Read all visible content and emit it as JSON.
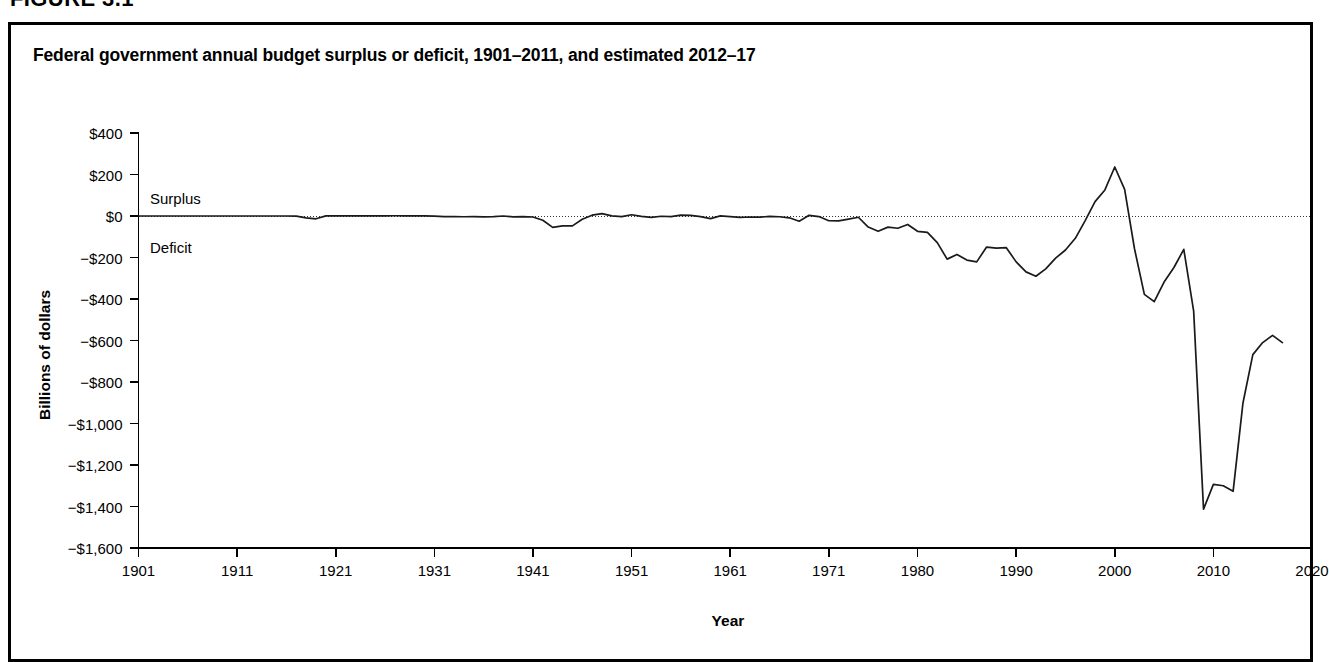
{
  "figure": {
    "number_label": "FIGURE 3.1"
  },
  "chart_title": "Federal government annual budget surplus or deficit, 1901–2011, and estimated 2012–17",
  "annotations": {
    "surplus": "Surplus",
    "deficit": "Deficit"
  },
  "colors": {
    "line": "#1a1a1a",
    "axis": "#000000",
    "zero_line": "#333333",
    "border": "#000000",
    "background": "#ffffff"
  },
  "chart_data": {
    "type": "line",
    "title": "Federal government annual budget surplus or deficit, 1901–2011, and estimated 2012–17",
    "xlabel": "Year",
    "ylabel": "Billions of dollars",
    "xlim": [
      1901,
      2020
    ],
    "ylim": [
      -1600,
      400
    ],
    "grid": false,
    "legend": null,
    "zero_reference_line": 0,
    "x_tick_labels": [
      "1901",
      "1911",
      "1921",
      "1931",
      "1941",
      "1951",
      "1961",
      "1971",
      "1980",
      "1990",
      "2000",
      "2010",
      "2020"
    ],
    "x_ticks": [
      1901,
      1911,
      1921,
      1931,
      1941,
      1951,
      1961,
      1971,
      1980,
      1990,
      2000,
      2010,
      2020
    ],
    "y_tick_labels": [
      "$400",
      "$200",
      "$0",
      "−$200",
      "−$400",
      "−$600",
      "−$800",
      "−$1,000",
      "−$1,200",
      "−$1,400",
      "−$1,600"
    ],
    "y_ticks": [
      400,
      200,
      0,
      -200,
      -400,
      -600,
      -800,
      -1000,
      -1200,
      -1400,
      -1600
    ],
    "series": [
      {
        "name": "Annual budget surplus or deficit",
        "x": [
          1901,
          1902,
          1903,
          1904,
          1905,
          1906,
          1907,
          1908,
          1909,
          1910,
          1911,
          1912,
          1913,
          1914,
          1915,
          1916,
          1917,
          1918,
          1919,
          1920,
          1921,
          1922,
          1923,
          1924,
          1925,
          1926,
          1927,
          1928,
          1929,
          1930,
          1931,
          1932,
          1933,
          1934,
          1935,
          1936,
          1937,
          1938,
          1939,
          1940,
          1941,
          1942,
          1943,
          1944,
          1945,
          1946,
          1947,
          1948,
          1949,
          1950,
          1951,
          1952,
          1953,
          1954,
          1955,
          1956,
          1957,
          1958,
          1959,
          1960,
          1961,
          1962,
          1963,
          1964,
          1965,
          1966,
          1967,
          1968,
          1969,
          1970,
          1971,
          1972,
          1973,
          1974,
          1975,
          1976,
          1977,
          1978,
          1979,
          1980,
          1981,
          1982,
          1983,
          1984,
          1985,
          1986,
          1987,
          1988,
          1989,
          1990,
          1991,
          1992,
          1993,
          1994,
          1995,
          1996,
          1997,
          1998,
          1999,
          2000,
          2001,
          2002,
          2003,
          2004,
          2005,
          2006,
          2007,
          2008,
          2009,
          2010,
          2011,
          2012,
          2013,
          2014,
          2015,
          2016,
          2017
        ],
        "values": [
          0.1,
          0.1,
          0.0,
          -0.0,
          -0.0,
          0.0,
          0.1,
          -0.06,
          -0.09,
          -0.02,
          0.01,
          -0.0,
          -0.0,
          0.0,
          -0.06,
          0.05,
          -0.85,
          -9.0,
          -13.4,
          0.3,
          0.5,
          0.7,
          0.7,
          1.0,
          0.7,
          0.9,
          1.2,
          0.9,
          0.7,
          0.7,
          -0.5,
          -2.7,
          -2.6,
          -3.6,
          -2.8,
          -4.3,
          -2.8,
          -0.1,
          -3.9,
          -2.9,
          -4.9,
          -20.5,
          -54.6,
          -47.6,
          -47.6,
          -15.9,
          4.0,
          11.8,
          0.6,
          -3.1,
          6.1,
          -1.5,
          -6.5,
          -1.2,
          -3.0,
          3.9,
          3.4,
          -2.8,
          -12.8,
          0.3,
          -3.3,
          -7.1,
          -4.8,
          -5.9,
          -1.4,
          -3.7,
          -8.6,
          -25.2,
          3.2,
          -2.8,
          -23.0,
          -23.4,
          -14.9,
          -6.1,
          -53.2,
          -73.7,
          -53.7,
          -59.2,
          -40.7,
          -73.8,
          -79.0,
          -128.0,
          -207.8,
          -185.4,
          -212.3,
          -221.2,
          -149.7,
          -155.2,
          -152.6,
          -221.0,
          -269.2,
          -290.3,
          -255.1,
          -203.2,
          -164.0,
          -107.4,
          -21.9,
          69.3,
          125.6,
          236.2,
          128.2,
          -157.8,
          -377.6,
          -412.7,
          -318.3,
          -248.2,
          -160.7,
          -458.6,
          -1412.7,
          -1293.5,
          -1300.0,
          -1327.0,
          -901.0,
          -668.0,
          -610.0,
          -575.0,
          -610.0
        ]
      }
    ],
    "notable_points": [
      {
        "year": 1919,
        "value": -13.4,
        "note": "World War I deficit"
      },
      {
        "year": 1943,
        "value": -54.6,
        "note": "World War II deficit"
      },
      {
        "year": 2000,
        "value": 236.2,
        "note": "Peak surplus"
      },
      {
        "year": 2009,
        "value": -1412.7,
        "note": "Peak deficit"
      }
    ]
  }
}
